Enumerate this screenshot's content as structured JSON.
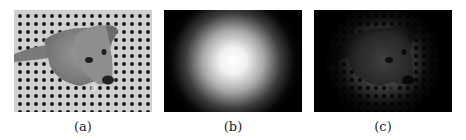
{
  "figure": {
    "panels": [
      {
        "id": "a",
        "caption": "(a)",
        "content": "grayscale photo of a puppy sitting on a dotted (polka-dot grid) floor, viewed from above"
      },
      {
        "id": "b",
        "caption": "(b)",
        "content": "radial gaussian mask: bright white center fading to black at the edges"
      },
      {
        "id": "c",
        "caption": "(c)",
        "content": "product of (a) and (b): puppy image visible only in center, darkened toward edges"
      }
    ]
  },
  "colors": {
    "background": "#ffffff",
    "floor_light": "#c8c8c8",
    "dot": "#1a1a1a",
    "mask_center": "#ffffff",
    "mask_edge": "#000000"
  }
}
